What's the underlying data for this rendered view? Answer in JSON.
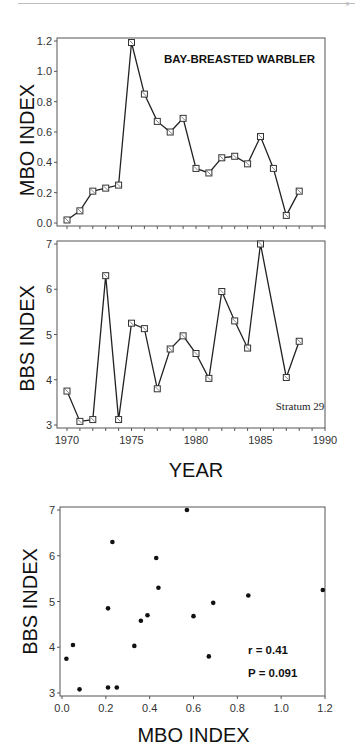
{
  "page": {
    "page_mark": "9"
  },
  "chart_data": [
    {
      "type": "line",
      "title": "BAY-BREASTED WARBLER",
      "xlabel": "",
      "ylabel": "MBO INDEX",
      "x": [
        1970,
        1971,
        1972,
        1973,
        1974,
        1975,
        1976,
        1977,
        1978,
        1979,
        1980,
        1981,
        1982,
        1983,
        1984,
        1985,
        1986,
        1987,
        1988
      ],
      "values": [
        0.02,
        0.08,
        0.21,
        0.23,
        0.25,
        1.19,
        0.85,
        0.67,
        0.6,
        0.69,
        0.36,
        0.33,
        0.43,
        0.44,
        0.39,
        0.57,
        0.36,
        0.05,
        0.21
      ],
      "xlim": [
        1970,
        1990
      ],
      "ylim": [
        0.0,
        1.2
      ],
      "yticks": [
        "0.0",
        "0.2",
        "0.4",
        "0.6",
        "0.8",
        "1.0",
        "1.2"
      ],
      "marker": "open-square",
      "grid": false
    },
    {
      "type": "line",
      "title": "",
      "annotation": "Stratum 29",
      "xlabel": "YEAR",
      "ylabel": "BBS INDEX",
      "x": [
        1970,
        1971,
        1972,
        1973,
        1974,
        1975,
        1976,
        1977,
        1978,
        1979,
        1980,
        1981,
        1982,
        1983,
        1984,
        1985,
        1987,
        1988
      ],
      "values": [
        3.75,
        3.08,
        3.12,
        6.3,
        3.12,
        5.25,
        5.13,
        3.8,
        4.68,
        4.97,
        4.58,
        4.03,
        5.95,
        5.3,
        4.7,
        7.0,
        4.05,
        4.85
      ],
      "xlim": [
        1970,
        1990
      ],
      "ylim": [
        3,
        7
      ],
      "xticks": [
        "1970",
        "1975",
        "1980",
        "1985",
        "1990"
      ],
      "yticks": [
        "3",
        "4",
        "5",
        "6",
        "7"
      ],
      "marker": "open-square",
      "grid": false
    },
    {
      "type": "scatter",
      "title": "",
      "xlabel": "MBO INDEX",
      "ylabel": "BBS INDEX",
      "points": [
        [
          0.02,
          3.75
        ],
        [
          0.08,
          3.08
        ],
        [
          0.21,
          3.12
        ],
        [
          0.23,
          6.3
        ],
        [
          0.25,
          3.12
        ],
        [
          1.19,
          5.25
        ],
        [
          0.85,
          5.13
        ],
        [
          0.67,
          3.8
        ],
        [
          0.6,
          4.68
        ],
        [
          0.69,
          4.97
        ],
        [
          0.36,
          4.58
        ],
        [
          0.33,
          4.03
        ],
        [
          0.43,
          5.95
        ],
        [
          0.44,
          5.3
        ],
        [
          0.39,
          4.7
        ],
        [
          0.57,
          7.0
        ],
        [
          0.05,
          4.05
        ],
        [
          0.21,
          4.85
        ]
      ],
      "xlim": [
        0.0,
        1.2
      ],
      "ylim": [
        3,
        7
      ],
      "xticks": [
        "0.0",
        "0.2",
        "0.4",
        "0.6",
        "0.8",
        "1.0",
        "1.2"
      ],
      "yticks": [
        "3",
        "4",
        "5",
        "6",
        "7"
      ],
      "annotations": [
        "r = 0.41",
        "P = 0.091"
      ],
      "grid": false
    }
  ]
}
